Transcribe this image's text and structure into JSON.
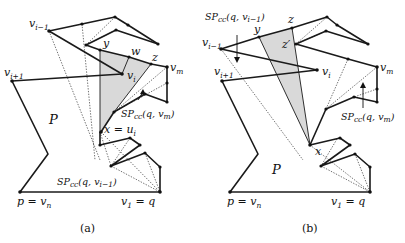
{
  "figure": {
    "panels": [
      {
        "id": "a",
        "caption": "(a)",
        "labels": {
          "v_im1": "v",
          "v_im1_sub": "i−1",
          "v_ip1": "v",
          "v_ip1_sub": "i+1",
          "v_i": "v",
          "v_i_sub": "i",
          "v_m": "v",
          "v_m_sub": "m",
          "y": "y",
          "w": "w",
          "z": "z",
          "P": "P",
          "x_eq_ui": "x = u",
          "x_eq_ui_sub": "i",
          "sp_vm": "SP",
          "sp_vm_sub": "cc",
          "sp_vm_args": "(q, v",
          "sp_vm_args_sub": "m",
          "sp_vm_close": ")",
          "sp_vim1": "SP",
          "sp_vim1_sub": "cc",
          "sp_vim1_args": "(q, v",
          "sp_vim1_args_sub": "i−1",
          "sp_vim1_close": ")",
          "p_eq_vn": "p = v",
          "p_eq_vn_sub": "n",
          "v1_eq_q": "v",
          "v1_eq_q_sub": "1",
          "v1_eq_q_rest": " = q"
        }
      },
      {
        "id": "b",
        "caption": "(b)",
        "labels": {
          "sp_vim1": "SP",
          "sp_vim1_sub": "cc",
          "sp_vim1_args": "(q, v",
          "sp_vim1_args_sub": "i−1",
          "sp_vim1_close": ")",
          "v_im1": "v",
          "v_im1_sub": "i−1",
          "v_ip1": "v",
          "v_ip1_sub": "i+1",
          "v_i": "v",
          "v_i_sub": "i",
          "v_m": "v",
          "v_m_sub": "m",
          "y": "y",
          "z": "z",
          "z_prime": "z′",
          "x": "x",
          "P": "P",
          "sp_vm": "SP",
          "sp_vm_sub": "cc",
          "sp_vm_args": "(q, v",
          "sp_vm_args_sub": "m",
          "sp_vm_close": ")",
          "p_eq_vn": "p = v",
          "p_eq_vn_sub": "n",
          "v1_eq_q": "v",
          "v1_eq_q_sub": "1",
          "v1_eq_q_rest": " = q"
        }
      }
    ],
    "colors": {
      "edge": "#1a1a1a",
      "shade": "#d9d9d9",
      "background": "#ffffff"
    }
  }
}
